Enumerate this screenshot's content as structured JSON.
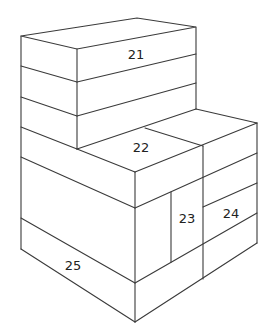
{
  "diagram": {
    "title": "",
    "type": "isometric stacked blocks",
    "line_color": "#3a3a3a",
    "labels": [
      {
        "id": "21",
        "text": "21",
        "x": 136,
        "y": 59
      },
      {
        "id": "22",
        "text": "22",
        "x": 141,
        "y": 152
      },
      {
        "id": "23",
        "text": "23",
        "x": 187,
        "y": 223
      },
      {
        "id": "24",
        "text": "24",
        "x": 231,
        "y": 218
      },
      {
        "id": "25",
        "text": "25",
        "x": 73,
        "y": 270
      }
    ]
  }
}
